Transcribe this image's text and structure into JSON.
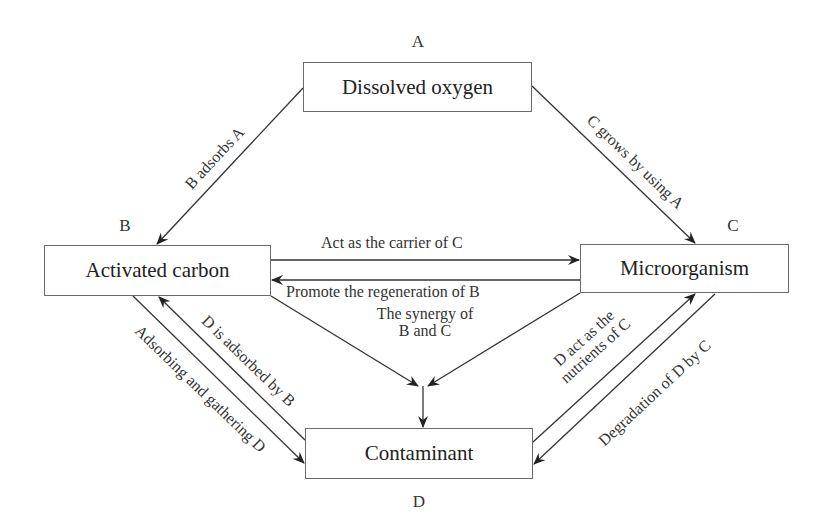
{
  "nodes": {
    "A": {
      "letter": "A",
      "label": "Dissolved oxygen"
    },
    "B": {
      "letter": "B",
      "label": "Activated carbon"
    },
    "C": {
      "letter": "C",
      "label": "Microorganism"
    },
    "D": {
      "letter": "D",
      "label": "Contaminant"
    }
  },
  "edges": {
    "a_to_b": "B adsorbs  A",
    "a_to_c": "C grows by using A",
    "b_to_c": "Act as the carrier of C",
    "c_to_b": "Promote the regeneration of B",
    "synergy_line1": "The synergy of",
    "synergy_line2": "B and C",
    "d_to_b": "D is adsorbed by B",
    "b_to_d": "Adsorbing and gathering D",
    "d_to_c_line1": "D act as the",
    "d_to_c_line2": "nutrients of C",
    "c_to_d": "Degradation of D  by C"
  },
  "colors": {
    "line": "#333333",
    "border": "#6b6b6b",
    "text": "#222222"
  }
}
